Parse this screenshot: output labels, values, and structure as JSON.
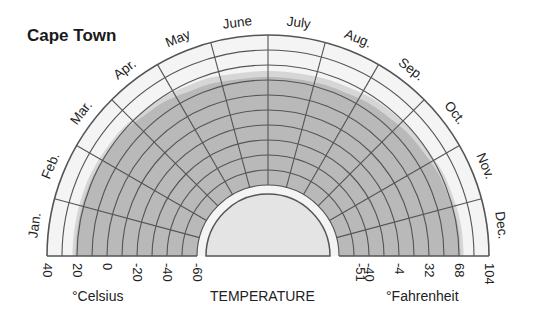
{
  "chart_data": {
    "type": "radial-area",
    "title": "Cape Town",
    "subtitle": "",
    "axis_label": "TEMPERATURE",
    "left_unit_label": "°Celsius",
    "right_unit_label": "°Fahrenheit",
    "months": [
      "Jan.",
      "Feb.",
      "Mar.",
      "Apr.",
      "May",
      "June",
      "July",
      "Aug.",
      "Sep.",
      "Oct.",
      "Nov.",
      "Dec."
    ],
    "celsius_ticks": [
      "40",
      "20",
      "0",
      "-20",
      "-40",
      "-60"
    ],
    "fahrenheit_ticks": [
      "-51",
      "-40",
      "-4",
      "32",
      "68",
      "104"
    ],
    "scale_celsius_range": [
      -60,
      40
    ],
    "series": [
      {
        "name": "Max temperature (°C, approx.)",
        "values": [
          21,
          21,
          20,
          17,
          14,
          12,
          12,
          13,
          15,
          17,
          19,
          21
        ]
      },
      {
        "name": "Light fringe upper bound (°C, approx.)",
        "values": [
          23,
          23,
          22,
          20,
          18,
          16,
          16,
          17,
          19,
          20,
          22,
          23
        ]
      }
    ],
    "grid": true,
    "legend": "none"
  },
  "colors": {
    "background": "#ffffff",
    "outer_ring": "#f4f4f4",
    "shade_dark": "#b9b9b9",
    "shade_light": "#d6d6d6",
    "inner_disc": "#e4e4e4",
    "grid": "#555555"
  }
}
